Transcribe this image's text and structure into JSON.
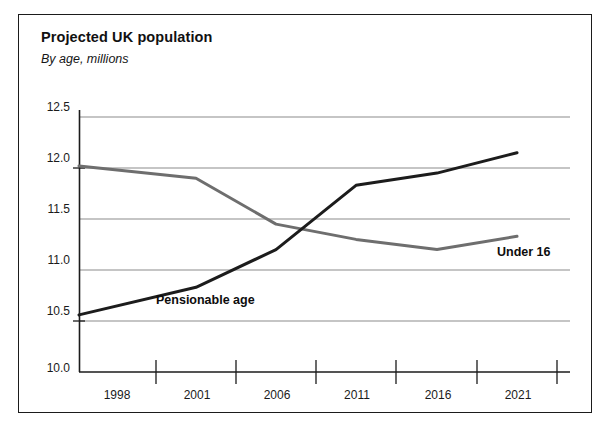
{
  "figure": {
    "title": "Projected UK population",
    "subtitle": "By age, millions"
  },
  "colors": {
    "under16_line": "#6e6e6e",
    "pensionable_line": "#1c1c1c",
    "gridline": "#8c8c8c",
    "axis": "#1b1b1b",
    "frame": "#1b1b1b",
    "text": "#111111",
    "background": "#ffffff"
  },
  "labels": {
    "under16": "Under 16",
    "pensionable": "Pensionable age"
  },
  "chart_data": {
    "type": "line",
    "title": "Projected UK population",
    "subtitle": "By age, millions",
    "xlabel": "",
    "ylabel": "millions",
    "x": [
      1998,
      2001,
      2006,
      2011,
      2016,
      2021
    ],
    "categories": [
      "1998",
      "2001",
      "2006",
      "2011",
      "2016",
      "2021"
    ],
    "xtick_labels": [
      "1998",
      "2001",
      "2006",
      "2011",
      "2016",
      "2021"
    ],
    "ytick_labels": [
      "10.0",
      "10.5",
      "11.0",
      "11.5",
      "12.0",
      "12.5"
    ],
    "ytick_values": [
      10.0,
      10.5,
      11.0,
      11.5,
      12.0,
      12.5
    ],
    "ylim": [
      10.0,
      12.5
    ],
    "grid": true,
    "grid_axis": "y",
    "legend_position": "inline-annotation",
    "series": [
      {
        "name": "Under 16",
        "color": "#6e6e6e",
        "values": [
          12.02,
          11.9,
          11.45,
          11.3,
          11.2,
          11.33
        ]
      },
      {
        "name": "Pensionable age",
        "color": "#1c1c1c",
        "values": [
          10.56,
          10.83,
          11.2,
          11.83,
          11.95,
          12.15
        ]
      }
    ],
    "annotations": [
      {
        "text": "Under 16",
        "series": "Under 16"
      },
      {
        "text": "Pensionable age",
        "series": "Pensionable age"
      }
    ]
  }
}
